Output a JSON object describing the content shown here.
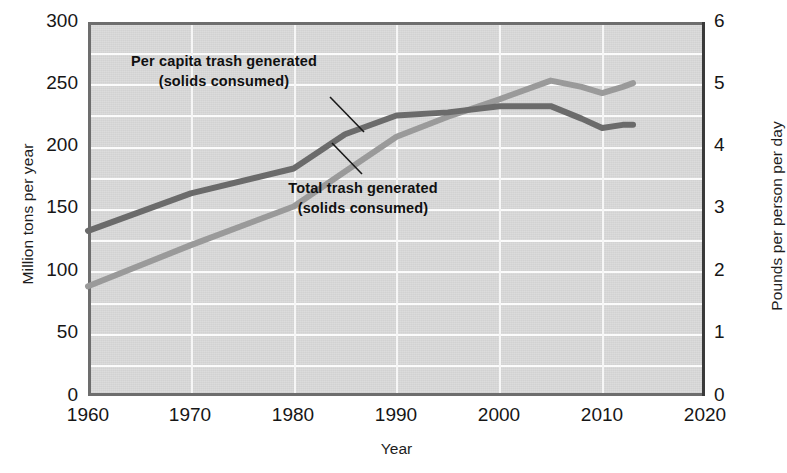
{
  "chart_data": {
    "type": "line",
    "title": "",
    "subtitle": "",
    "xlabel": "Year",
    "ylabel": "Million tons per year",
    "ylabel_right": "Pounds per person per day",
    "xlim": [
      1960,
      2020
    ],
    "ylim": [
      0,
      300
    ],
    "ylim_right": [
      0,
      6
    ],
    "xticks": [
      1960,
      1970,
      1980,
      1990,
      2000,
      2010,
      2020
    ],
    "xticklabels": [
      "1960",
      "1970",
      "1980",
      "1990",
      "2000",
      "2010",
      "2020"
    ],
    "yticks": [
      0,
      50,
      100,
      150,
      200,
      250,
      300
    ],
    "yticklabels": [
      "0",
      "50",
      "100",
      "150",
      "200",
      "250",
      "300"
    ],
    "yticks_right": [
      0,
      1,
      2,
      3,
      4,
      5,
      6
    ],
    "yticklabels_right": [
      "0",
      "1",
      "2",
      "3",
      "4",
      "5",
      "6"
    ],
    "grid": true,
    "grid_minor_y_step": 25,
    "legend_position": "inline-annotations",
    "series": [
      {
        "name": "Per capita trash generated (solids consumed)",
        "axis": "right",
        "units": "Pounds per person per day",
        "color": "#6b6b6b",
        "x": [
          1960,
          1970,
          1980,
          1985,
          1990,
          1995,
          2000,
          2005,
          2008,
          2010,
          2012,
          2013
        ],
        "values": [
          2.65,
          3.25,
          3.65,
          4.2,
          4.5,
          4.55,
          4.65,
          4.65,
          4.45,
          4.3,
          4.35,
          4.35
        ]
      },
      {
        "name": "Total trash generated (solids consumed)",
        "axis": "left",
        "units": "Million tons per year",
        "color": "#9a9a9a",
        "x": [
          1960,
          1970,
          1980,
          1985,
          1990,
          1995,
          2000,
          2005,
          2008,
          2010,
          2012,
          2013
        ],
        "values": [
          88,
          121,
          152,
          180,
          208,
          224,
          238,
          253,
          248,
          243,
          248,
          251
        ]
      }
    ],
    "annotations": [
      {
        "id": "per-capita",
        "line1": "Per capita trash generated",
        "line2": "(solids consumed)",
        "target_series": "Per capita trash generated (solids consumed)"
      },
      {
        "id": "total",
        "line1": "Total trash generated",
        "line2": "(solids consumed)",
        "target_series": "Total trash generated (solids consumed)"
      }
    ]
  }
}
